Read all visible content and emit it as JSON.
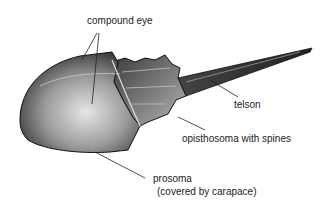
{
  "diagram": {
    "labels": {
      "compound_eye": "compound eye",
      "telson": "telson",
      "opisthosoma": "opisthosoma with spines",
      "prosoma": "prosoma",
      "prosoma_note": "(covered by carapace)"
    },
    "colors": {
      "ink": "#222222",
      "shell_dark": "#2a2a2a",
      "shell_mid": "#7a7a7a",
      "shell_light": "#d8d8d8"
    }
  }
}
